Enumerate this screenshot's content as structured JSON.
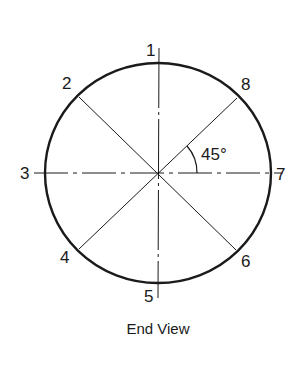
{
  "diagram": {
    "type": "circle-positions",
    "caption": "End View",
    "angle_label": "45°",
    "stroke_color": "#1a1a1a",
    "background": "#ffffff",
    "positions": [
      {
        "label": "1",
        "angle_deg": 90
      },
      {
        "label": "2",
        "angle_deg": 135
      },
      {
        "label": "3",
        "angle_deg": 180
      },
      {
        "label": "4",
        "angle_deg": 225
      },
      {
        "label": "5",
        "angle_deg": 270
      },
      {
        "label": "6",
        "angle_deg": 315
      },
      {
        "label": "7",
        "angle_deg": 0
      },
      {
        "label": "8",
        "angle_deg": 45
      }
    ]
  }
}
